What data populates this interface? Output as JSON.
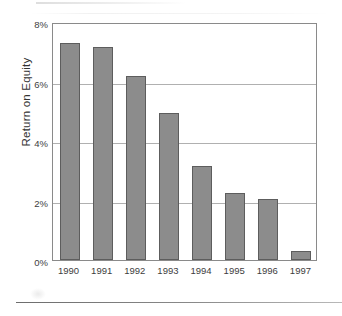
{
  "chart_data": {
    "type": "bar",
    "title": "",
    "subtitle": "",
    "xlabel": "",
    "ylabel": "Return on Equity",
    "categories": [
      "1990",
      "1991",
      "1992",
      "1993",
      "1994",
      "1995",
      "1996",
      "1997"
    ],
    "values": [
      7.3,
      7.15,
      6.2,
      4.95,
      3.15,
      2.25,
      2.05,
      0.3
    ],
    "value_unit": "%",
    "ylim": [
      0,
      8
    ],
    "ytick_values": [
      0,
      2,
      4,
      6,
      8
    ],
    "ytick_labels": [
      "0%",
      "2%",
      "4%",
      "6%",
      "8%"
    ],
    "grid": "horizontal",
    "legend": "none",
    "series": [
      {
        "name": "Return on Equity",
        "values": [
          7.3,
          7.15,
          6.2,
          4.95,
          3.15,
          2.25,
          2.05,
          0.3
        ]
      }
    ],
    "colors": {
      "bar_fill": "#8c8c8c",
      "bar_border": "#5d5d5d",
      "gridline": "#b0b0b0",
      "frame": "#8a8a8a",
      "text": "#3d3d3d",
      "background": "#ffffff"
    }
  }
}
